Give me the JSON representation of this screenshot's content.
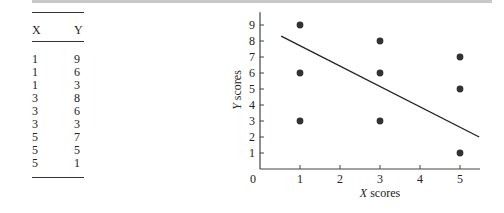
{
  "table": {
    "headers": [
      "X",
      "Y"
    ],
    "rows": [
      [
        "1",
        "9"
      ],
      [
        "1",
        "6"
      ],
      [
        "1",
        "3"
      ],
      [
        "3",
        "8"
      ],
      [
        "3",
        "6"
      ],
      [
        "3",
        "3"
      ],
      [
        "5",
        "7"
      ],
      [
        "5",
        "5"
      ],
      [
        "5",
        "1"
      ]
    ]
  },
  "chart_data": {
    "type": "scatter",
    "title": "",
    "xlabel": "X scores",
    "ylabel": "Y scores",
    "xlim": [
      0,
      5.5
    ],
    "ylim": [
      0,
      9.8
    ],
    "x_ticks": [
      "0",
      "1",
      "2",
      "3",
      "4",
      "5"
    ],
    "y_ticks": [
      "1",
      "2",
      "3",
      "4",
      "5",
      "6",
      "7",
      "8",
      "9"
    ],
    "grid": false,
    "points": [
      {
        "x": 1,
        "y": 9
      },
      {
        "x": 1,
        "y": 6
      },
      {
        "x": 1,
        "y": 3
      },
      {
        "x": 3,
        "y": 8
      },
      {
        "x": 3,
        "y": 6
      },
      {
        "x": 3,
        "y": 3
      },
      {
        "x": 5,
        "y": 7
      },
      {
        "x": 5,
        "y": 5
      },
      {
        "x": 5,
        "y": 1
      }
    ],
    "regression_line": {
      "x1": 0.53,
      "y1": 8.3,
      "x2": 5.48,
      "y2": 2.0
    }
  }
}
